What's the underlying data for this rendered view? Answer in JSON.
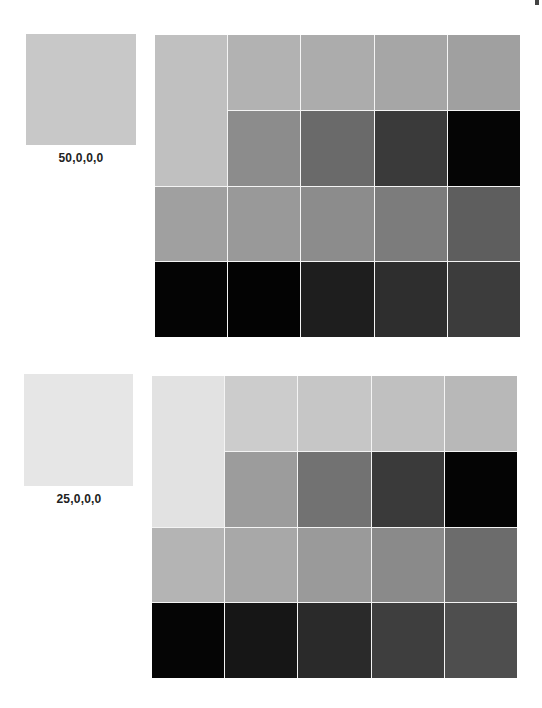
{
  "sections": [
    {
      "label": "50,0,0,0",
      "swatch_color": "#c8c8c8",
      "grid": {
        "first_tall_color": "#c0c0c0",
        "row1": [
          "#b2b2b2",
          "#acacac",
          "#a6a6a6",
          "#a0a0a0"
        ],
        "row2": [
          "#8c8c8c",
          "#6a6a6a",
          "#3a3a3a",
          "#050505"
        ],
        "row3": [
          "#a0a0a0",
          "#999999",
          "#8c8c8c",
          "#7c7c7c",
          "#5e5e5e"
        ],
        "row4": [
          "#040404",
          "#030303",
          "#1e1e1e",
          "#2e2e2e",
          "#3c3c3c"
        ]
      }
    },
    {
      "label": "25,0,0,0",
      "swatch_color": "#e6e6e6",
      "grid": {
        "first_tall_color": "#e2e2e2",
        "row1": [
          "#cccccc",
          "#c6c6c6",
          "#c0c0c0",
          "#b8b8b8"
        ],
        "row2": [
          "#9c9c9c",
          "#727272",
          "#3a3a3a",
          "#040404"
        ],
        "row3": [
          "#b4b4b4",
          "#a8a8a8",
          "#9a9a9a",
          "#8a8a8a",
          "#6c6c6c"
        ],
        "row4": [
          "#050505",
          "#161616",
          "#2a2a2a",
          "#3e3e3e",
          "#4e4e4e"
        ]
      }
    }
  ]
}
